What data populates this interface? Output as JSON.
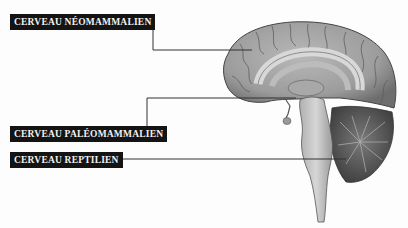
{
  "diagram": {
    "labels": [
      {
        "id": "neomammalien",
        "text": "CERVEAU NÉOMAMMALIEN",
        "points_to": "cortex"
      },
      {
        "id": "paleomammalien",
        "text": "CERVEAU PALÉOMAMMALIEN",
        "points_to": "limbic system"
      },
      {
        "id": "reptilien",
        "text": "CERVEAU REPTILIEN",
        "points_to": "brainstem / cerebellum"
      }
    ],
    "colors": {
      "label_bg": "#141414",
      "label_text": "#f2f2f2",
      "leader_line": "#333333",
      "brain_gray": "#9a9a9a"
    }
  }
}
